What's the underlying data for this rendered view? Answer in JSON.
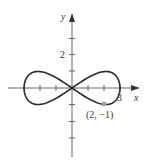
{
  "chart_data": {
    "type": "line",
    "title": "",
    "xlabel": "x",
    "ylabel": "y",
    "curve": "figure-eight (lemniscate-like) curve through origin",
    "x_range": [
      -3,
      3
    ],
    "y_range": [
      -1,
      1
    ],
    "x_ticks": [
      -3,
      -2,
      -1,
      1,
      2,
      3
    ],
    "y_ticks": [
      -4,
      -3,
      -2,
      -1,
      1,
      2,
      3
    ],
    "x_tick_labels": [
      "3"
    ],
    "y_tick_labels": [
      "2"
    ],
    "marked_point": {
      "x": 2,
      "y": -1,
      "label": "(2, −1)"
    },
    "grid": false
  },
  "axes": {
    "x_label": "x",
    "y_label": "y",
    "x_tick_label_3": "3",
    "y_tick_label_2": "2"
  },
  "point_label": "(2, −1)",
  "colors": {
    "curve": "#2a2a2a",
    "axes": "#555555",
    "point": "#a0a0a0"
  }
}
